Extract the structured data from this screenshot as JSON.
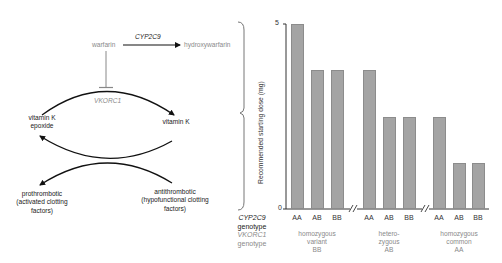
{
  "pathway": {
    "warfarin": "warfarin",
    "enzyme_cyp2c9": "CYP2C9",
    "hydroxywarfarin": "hydroxywarfarin",
    "enzyme_vkorc1": "VKORC1",
    "vitk_epoxide_line1": "vitamin K",
    "vitk_epoxide_line2": "epoxide",
    "vitamin_k": "vitamin K",
    "prothrombotic_line1": "prothrombotic",
    "prothrombotic_line2": "(activated clotting",
    "prothrombotic_line3": "factors)",
    "antithrombotic_line1": "antithrombotic",
    "antithrombotic_line2": "(hypofunctional clotting",
    "antithrombotic_line3": "factors)"
  },
  "chart_data": {
    "type": "bar",
    "title": "",
    "ylabel": "Recommended starting dose (mg)",
    "xlabel": "",
    "ylim": [
      0,
      5
    ],
    "yticks": [
      "0",
      "5"
    ],
    "grid": false,
    "row_labels": {
      "cyp2c9": "CYP2C9",
      "cyp2c9_sub": "genotype",
      "vkorc1": "VKORC1",
      "vkorc1_sub": "genotype"
    },
    "groups": [
      {
        "label_lines": [
          "homozygous",
          "variant",
          "BB"
        ],
        "categories": [
          "AA",
          "AB",
          "BB"
        ],
        "values": [
          5,
          3.75,
          3.75
        ]
      },
      {
        "label_lines": [
          "hetero-",
          "zygous",
          "AB"
        ],
        "categories": [
          "AA",
          "AB",
          "BB"
        ],
        "values": [
          3.75,
          2.5,
          2.5
        ]
      },
      {
        "label_lines": [
          "homozygous",
          "common",
          "AA"
        ],
        "categories": [
          "AA",
          "AB",
          "BB"
        ],
        "values": [
          2.5,
          1.25,
          1.25
        ]
      }
    ],
    "axis_break_symbol": "//",
    "bar_color": "#a4a4a4"
  }
}
